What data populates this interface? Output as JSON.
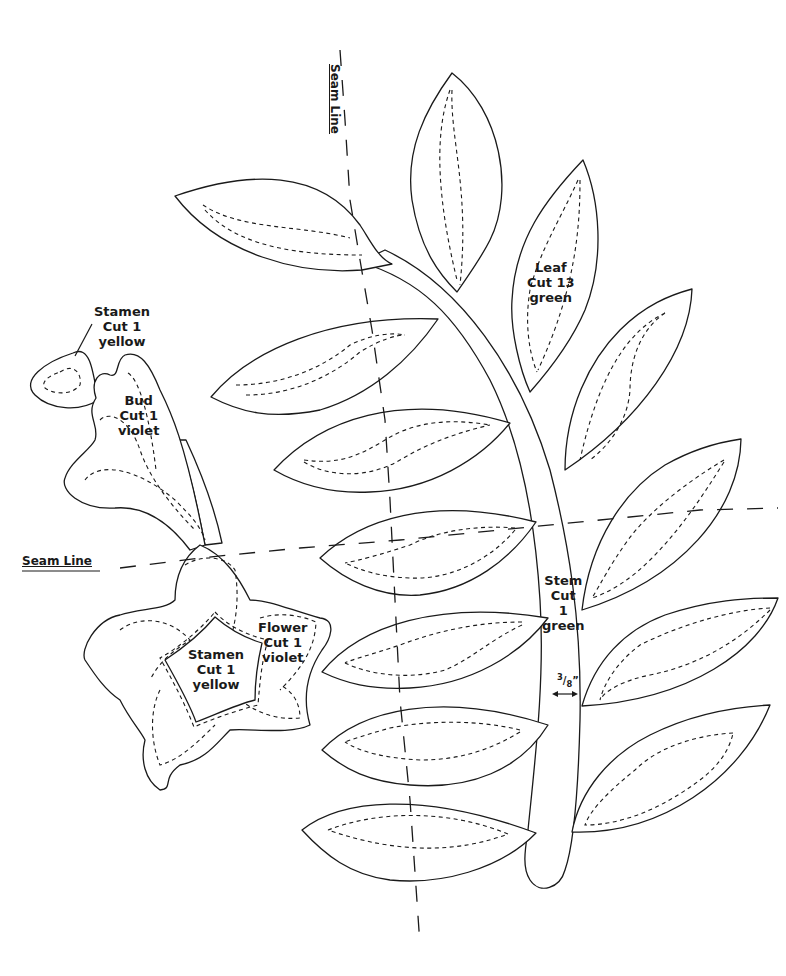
{
  "pattern": {
    "colors": {
      "line": "#1a1a1a",
      "background": "#ffffff"
    },
    "seam_lines": [
      {
        "id": "vertical",
        "label": "Seam Line"
      },
      {
        "id": "horizontal",
        "label": "Seam Line"
      }
    ],
    "pieces": {
      "stamen_bud": {
        "name": "Stamen",
        "cut": "Cut 1",
        "color": "yellow"
      },
      "bud": {
        "name": "Bud",
        "cut": "Cut 1",
        "color": "violet"
      },
      "leaf": {
        "name": "Leaf",
        "cut": "Cut 13",
        "color": "green"
      },
      "stamen_flower": {
        "name": "Stamen",
        "cut": "Cut 1",
        "color": "yellow"
      },
      "flower": {
        "name": "Flower",
        "cut": "Cut 1",
        "color": "violet"
      },
      "stem": {
        "name": "Stem",
        "cut": "Cut",
        "count": "1",
        "color": "green"
      }
    },
    "stem_width": {
      "numerator": "3",
      "denominator": "8",
      "unit": "”",
      "arrow": "↔"
    }
  }
}
